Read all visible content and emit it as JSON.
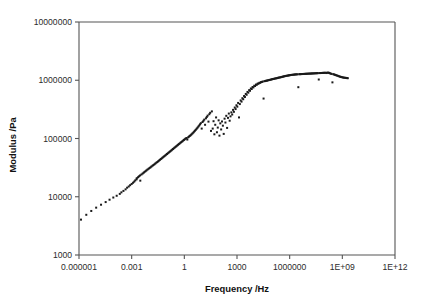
{
  "chart_data": {
    "type": "scatter",
    "title": "",
    "subtitle": "",
    "xlabel": "Frequency /Hz",
    "ylabel": "Modulus /Pa",
    "xscale": "log",
    "yscale": "log",
    "xlim": [
      1e-06,
      1000000000000.0
    ],
    "ylim": [
      1000,
      10000000
    ],
    "grid": false,
    "legend": null,
    "legend_position": "none",
    "xtick_labels": [
      "0.000001",
      "0.001",
      "1",
      "1000",
      "1000000",
      "1E+09",
      "1E+12"
    ],
    "xtick_values": [
      1e-06,
      0.001,
      1,
      1000,
      1000000,
      1000000000.0,
      1000000000000.0
    ],
    "ytick_labels": [
      "1000",
      "10000",
      "100000",
      "1000000",
      "10000000"
    ],
    "ytick_values": [
      1000,
      10000,
      100000,
      1000000,
      10000000
    ],
    "marker": "square",
    "marker_size": 2,
    "marker_color": "#1a1a1a",
    "series": [
      {
        "name": "Master curve",
        "points": [
          [
            1.3e-06,
            4050
          ],
          [
            2.6e-06,
            4900
          ],
          [
            5e-06,
            5700
          ],
          [
            9.5e-06,
            6500
          ],
          [
            1.8e-05,
            7300
          ],
          [
            3.3e-05,
            8100
          ],
          [
            5.5e-05,
            8900
          ],
          [
            9e-05,
            9700
          ],
          [
            0.00014,
            10400
          ],
          [
            0.00021,
            11200
          ],
          [
            0.00026,
            11900
          ],
          [
            0.00034,
            12600
          ],
          [
            0.00045,
            13400
          ],
          [
            0.00055,
            14300
          ],
          [
            0.00068,
            15000
          ],
          [
            0.00082,
            15800
          ],
          [
            0.001,
            16600
          ],
          [
            0.0012,
            17400
          ],
          [
            0.0014,
            18200
          ],
          [
            0.0016,
            19100
          ],
          [
            0.0019,
            19900
          ],
          [
            0.00195,
            20800
          ],
          [
            0.0023,
            21600
          ],
          [
            0.0026,
            22400
          ],
          [
            0.003,
            23200
          ],
          [
            0.0031,
            18900
          ],
          [
            0.0036,
            24100
          ],
          [
            0.0042,
            25000
          ],
          [
            0.0048,
            25800
          ],
          [
            0.0054,
            26700
          ],
          [
            0.0062,
            27500
          ],
          [
            0.007,
            28400
          ],
          [
            0.008,
            29300
          ],
          [
            0.0092,
            30200
          ],
          [
            0.0105,
            31200
          ],
          [
            0.012,
            32100
          ],
          [
            0.0135,
            33100
          ],
          [
            0.0155,
            34100
          ],
          [
            0.0175,
            35100
          ],
          [
            0.02,
            36200
          ],
          [
            0.0225,
            37300
          ],
          [
            0.0255,
            38400
          ],
          [
            0.029,
            39500
          ],
          [
            0.0325,
            40700
          ],
          [
            0.0365,
            41900
          ],
          [
            0.041,
            43100
          ],
          [
            0.046,
            44400
          ],
          [
            0.052,
            45700
          ],
          [
            0.058,
            47000
          ],
          [
            0.065,
            48400
          ],
          [
            0.073,
            49800
          ],
          [
            0.082,
            51200
          ],
          [
            0.092,
            52700
          ],
          [
            0.103,
            54200
          ],
          [
            0.115,
            55800
          ],
          [
            0.13,
            57400
          ],
          [
            0.145,
            59000
          ],
          [
            0.162,
            60700
          ],
          [
            0.181,
            62400
          ],
          [
            0.202,
            64200
          ],
          [
            0.226,
            66000
          ],
          [
            0.252,
            67900
          ],
          [
            0.282,
            69800
          ],
          [
            0.315,
            71800
          ],
          [
            0.352,
            73800
          ],
          [
            0.393,
            75900
          ],
          [
            0.439,
            78000
          ],
          [
            0.49,
            80200
          ],
          [
            0.548,
            82400
          ],
          [
            0.612,
            84700
          ],
          [
            0.684,
            87100
          ],
          [
            0.764,
            89500
          ],
          [
            0.853,
            92000
          ],
          [
            0.953,
            94500
          ],
          [
            1.06,
            97100
          ],
          [
            1.19,
            99800
          ],
          [
            1.33,
            102000
          ],
          [
            1.48,
            96000
          ],
          [
            1.66,
            105000
          ],
          [
            1.85,
            108000
          ],
          [
            2.07,
            111000
          ],
          [
            2.31,
            114000
          ],
          [
            2.58,
            118000
          ],
          [
            2.88,
            122000
          ],
          [
            3.22,
            126000
          ],
          [
            3.6,
            131000
          ],
          [
            4.02,
            136000
          ],
          [
            4.49,
            141000
          ],
          [
            5.02,
            147000
          ],
          [
            5.6,
            153000
          ],
          [
            6.26,
            160000
          ],
          [
            7.0,
            167000
          ],
          [
            7.82,
            175000
          ],
          [
            8.73,
            183000
          ],
          [
            9.76,
            148000
          ],
          [
            10.9,
            192000
          ],
          [
            12.2,
            201000
          ],
          [
            13.6,
            211000
          ],
          [
            15.2,
            172000
          ],
          [
            17.0,
            222000
          ],
          [
            19.0,
            234000
          ],
          [
            21.2,
            247000
          ],
          [
            23.7,
            195000
          ],
          [
            26.5,
            261000
          ],
          [
            29.6,
            276000
          ],
          [
            33.0,
            135000
          ],
          [
            37.0,
            292000
          ],
          [
            41.3,
            148000
          ],
          [
            46.1,
            198000
          ],
          [
            51.5,
            118000
          ],
          [
            57.6,
            172000
          ],
          [
            64.3,
            230000
          ],
          [
            71.9,
            128000
          ],
          [
            80.3,
            154000
          ],
          [
            89.7,
            205000
          ],
          [
            100,
            112000
          ],
          [
            112,
            182000
          ],
          [
            125,
            143000
          ],
          [
            140,
            196000
          ],
          [
            157,
            166000
          ],
          [
            175,
            120000
          ],
          [
            196,
            219000
          ],
          [
            219,
            188000
          ],
          [
            245,
            245000
          ],
          [
            273,
            152000
          ],
          [
            306,
            226000
          ],
          [
            342,
            268000
          ],
          [
            382,
            202000
          ],
          [
            427,
            240000
          ],
          [
            477,
            281000
          ],
          [
            533,
            258000
          ],
          [
            596,
            310000
          ],
          [
            666,
            287000
          ],
          [
            745,
            340000
          ],
          [
            832,
            320000
          ],
          [
            930,
            372000
          ],
          [
            1040,
            352000
          ],
          [
            1160,
            408000
          ],
          [
            1300,
            230000
          ],
          [
            1450,
            390000
          ],
          [
            1620,
            450000
          ],
          [
            1810,
            430000
          ],
          [
            2030,
            492000
          ],
          [
            2260,
            472000
          ],
          [
            2530,
            536000
          ],
          [
            2830,
            516000
          ],
          [
            3160,
            582000
          ],
          [
            3530,
            563000
          ],
          [
            3950,
            630000
          ],
          [
            4410,
            612000
          ],
          [
            4930,
            676000
          ],
          [
            5510,
            660000
          ],
          [
            6160,
            722000
          ],
          [
            6880,
            708000
          ],
          [
            7690,
            765000
          ],
          [
            8600,
            753000
          ],
          [
            9600,
            805000
          ],
          [
            10700.0,
            796000
          ],
          [
            12000.0,
            842000
          ],
          [
            13400.0,
            836000
          ],
          [
            15000.0,
            875000
          ],
          [
            16700.0,
            872000
          ],
          [
            18700.0,
            903000
          ],
          [
            20900.0,
            905000
          ],
          [
            23300.0,
            928000
          ],
          [
            26100.0,
            935000
          ],
          [
            29100.0,
            950000
          ],
          [
            32600.0,
            485000
          ],
          [
            36400.0,
            962000
          ],
          [
            40700.0,
            972000
          ],
          [
            45500.0,
            980000
          ],
          [
            50800.0,
            985000
          ],
          [
            56800.0,
            995000
          ],
          [
            63500.0,
            1005000
          ],
          [
            70900.0,
            1012000
          ],
          [
            79300.0,
            1020000
          ],
          [
            88600.0,
            1030000
          ],
          [
            99000.0,
            1040000
          ],
          [
            111000.0,
            1050000
          ],
          [
            124000.0,
            1055000
          ],
          [
            138000.0,
            1065000
          ],
          [
            155000.0,
            1075000
          ],
          [
            173000.0,
            1080000
          ],
          [
            193000.0,
            1090000
          ],
          [
            216000.0,
            1100000
          ],
          [
            241000.0,
            1110000
          ],
          [
            270000.0,
            1115000
          ],
          [
            301000.0,
            1125000
          ],
          [
            337000.0,
            1135000
          ],
          [
            376000.0,
            1145000
          ],
          [
            420000.0,
            1155000
          ],
          [
            470000.0,
            1165000
          ],
          [
            525000.0,
            1175000
          ],
          [
            587000.0,
            1185000
          ],
          [
            656000.0,
            1190000
          ],
          [
            733000.0,
            1200000
          ],
          [
            819000.0,
            1205000
          ],
          [
            916000.0,
            1215000
          ],
          [
            1020000.0,
            1220000
          ],
          [
            1140000.0,
            1230000
          ],
          [
            1280000.0,
            1235000
          ],
          [
            1430000.0,
            1240000
          ],
          [
            1600000.0,
            1245000
          ],
          [
            1790000.0,
            1250000
          ],
          [
            2000000.0,
            1255000
          ],
          [
            2230000.0,
            1260000
          ],
          [
            2500000.0,
            1262000
          ],
          [
            2790000.0,
            1265000
          ],
          [
            3120000.0,
            760000
          ],
          [
            3490000.0,
            1270000
          ],
          [
            3900000.0,
            1272000
          ],
          [
            4360000.0,
            1275000
          ],
          [
            4880000.0,
            1278000
          ],
          [
            5450000.0,
            1280000
          ],
          [
            6090000.0,
            1282000
          ],
          [
            6810000.0,
            1285000
          ],
          [
            7620000.0,
            1288000
          ],
          [
            8510000.0,
            1290000
          ],
          [
            9520000.0,
            1292000
          ],
          [
            10600000.0,
            1295000
          ],
          [
            11900000.0,
            1298000
          ],
          [
            13300000.0,
            1300000
          ],
          [
            14900000.0,
            1302000
          ],
          [
            16600000.0,
            1305000
          ],
          [
            18600000.0,
            1308000
          ],
          [
            20800000.0,
            1310000
          ],
          [
            23300000.0,
            1312000
          ],
          [
            26000000.0,
            1315000
          ],
          [
            29100000.0,
            1318000
          ],
          [
            32500000.0,
            1320000
          ],
          [
            36400000.0,
            1322000
          ],
          [
            40700000.0,
            1325000
          ],
          [
            45500000.0,
            1030000
          ],
          [
            50900000.0,
            1328000
          ],
          [
            56900000.0,
            1330000
          ],
          [
            63600000.0,
            1332000
          ],
          [
            71200000.0,
            1335000
          ],
          [
            79600000.0,
            1338000
          ],
          [
            89000000.0,
            1340000
          ],
          [
            99600000.0,
            1342000
          ],
          [
            111000000.0,
            1345000
          ],
          [
            125000000.0,
            1330000
          ],
          [
            139000000.0,
            1348000
          ],
          [
            156000000.0,
            1350000
          ],
          [
            174000000.0,
            1340000
          ],
          [
            195000000.0,
            1320000
          ],
          [
            218000000.0,
            1300000
          ],
          [
            244000000.0,
            1285000
          ],
          [
            273000000.0,
            920000
          ],
          [
            305000000.0,
            1270000
          ],
          [
            341000000.0,
            1255000
          ],
          [
            382000000.0,
            1240000
          ],
          [
            427000000.0,
            1225000
          ],
          [
            478000000.0,
            1210000
          ],
          [
            535000000.0,
            1195000
          ],
          [
            598000000.0,
            1180000
          ],
          [
            669000000.0,
            1165000
          ],
          [
            749000000.0,
            1150000
          ],
          [
            838000000.0,
            1140000
          ],
          [
            937000000.0,
            1130000
          ],
          [
            1050000000.0,
            1120000
          ],
          [
            1170000000.0,
            1110000
          ],
          [
            1310000000.0,
            1105000
          ],
          [
            1470000000.0,
            1100000
          ],
          [
            1640000000.0,
            1095000
          ],
          [
            1830000000.0,
            1090000
          ],
          [
            2050000000.0,
            1085000
          ]
        ]
      }
    ]
  },
  "figure": {
    "background_color": "#ffffff",
    "axis_color": "#555555",
    "text_color": "#1a1a1a"
  }
}
